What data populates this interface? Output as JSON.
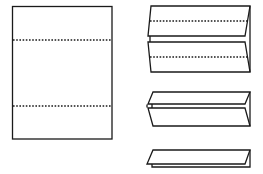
{
  "diagram": {
    "colors": {
      "stroke": "#1a1a1a",
      "background": "#ffffff"
    },
    "steps": [
      {
        "id": "flat-sheet",
        "label": "Flat sheet with two fold lines",
        "fold_lines": 2
      },
      {
        "id": "partially-folded",
        "label": "Both flaps folded along fold lines",
        "fold_lines": 2
      },
      {
        "id": "folded-in",
        "label": "Flaps folded inward"
      },
      {
        "id": "folded-strip",
        "label": "Folded into thin strip"
      }
    ]
  }
}
